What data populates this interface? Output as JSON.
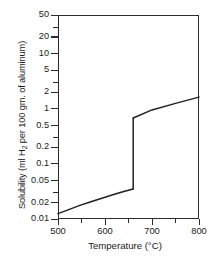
{
  "chart_data": {
    "type": "line",
    "title": "",
    "subtitle": "",
    "xlabel": "Temperature (°C)",
    "ylabel_prefix": "Solubility (ml  H",
    "ylabel_sub": "2",
    "ylabel_suffix": " per 100 gm. of aluminum)",
    "ylabel_plain": "Solubility (ml H2 per 100 gm. of aluminum)",
    "yscale": "log",
    "xscale": "linear",
    "xlim": [
      500,
      800
    ],
    "ylim": [
      0.01,
      50
    ],
    "grid": false,
    "legend": false,
    "xticks": [
      500,
      600,
      700,
      800
    ],
    "xticks_minor": [
      550,
      650,
      750
    ],
    "xtick_labels": [
      "500",
      "600",
      "700",
      "800"
    ],
    "yticks": [
      0.01,
      0.02,
      0.05,
      0.1,
      0.2,
      0.5,
      1,
      2,
      5,
      10,
      20,
      50
    ],
    "ytick_labels": [
      "0.01",
      "0.02",
      "0.05",
      "0.1",
      "0.2",
      "0.5",
      "1",
      "2",
      "5",
      "10",
      "20",
      "50"
    ],
    "line_color": "#231f20",
    "annotations": [],
    "series": [
      {
        "name": "Hydrogen solubility in solid aluminum",
        "phase": "solid",
        "x": [
          500,
          520,
          545,
          570,
          595,
          620,
          640,
          660
        ],
        "values": [
          0.0125,
          0.0145,
          0.0175,
          0.0205,
          0.024,
          0.028,
          0.0315,
          0.035
        ]
      },
      {
        "name": "Melting transition at 660 °C",
        "phase": "transition",
        "x": [
          660,
          660
        ],
        "values": [
          0.035,
          0.68
        ]
      },
      {
        "name": "Hydrogen solubility in liquid aluminum",
        "phase": "liquid",
        "x": [
          660,
          700,
          750,
          800
        ],
        "values": [
          0.68,
          0.95,
          1.25,
          1.62
        ]
      }
    ]
  }
}
